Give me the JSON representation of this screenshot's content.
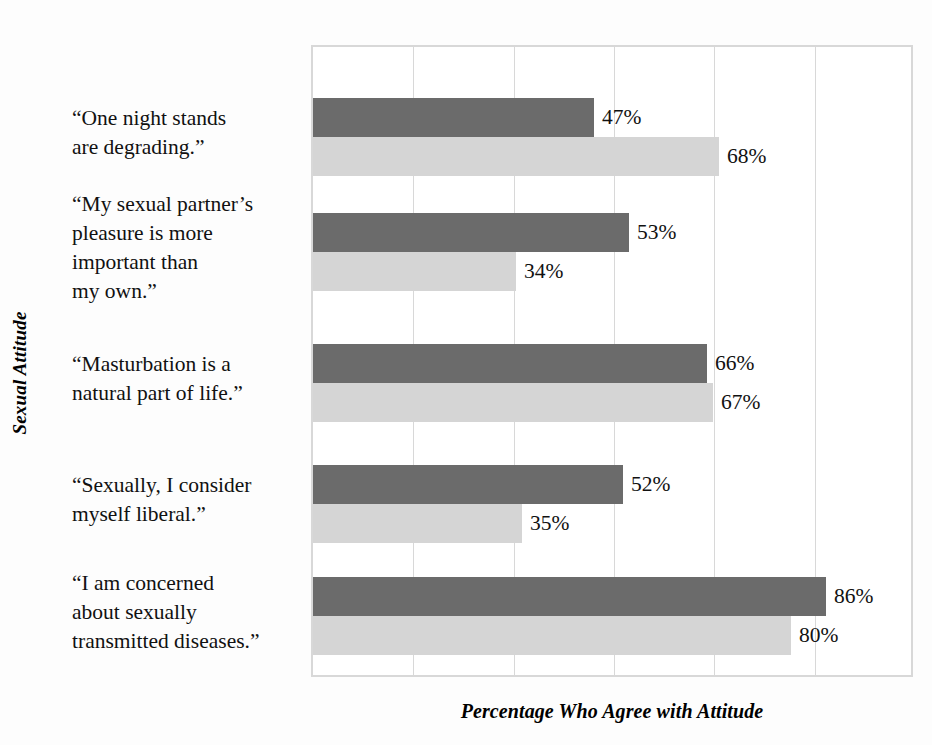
{
  "chart_data": {
    "type": "bar",
    "orientation": "horizontal",
    "title": "",
    "xlabel": "Percentage Who Agree with Attitude",
    "ylabel": "Sexual Attitude",
    "xlim": [
      0,
      100
    ],
    "grid": true,
    "gridline_count": 6,
    "legend_position": "top-right",
    "value_suffix": "%",
    "categories": [
      "“One night stands are degrading.”",
      "“My sexual partner’s pleasure is more important than my own.”",
      "“Masturbation is a natural part of life.”",
      "“Sexually, I consider myself liberal.”",
      "“I am concerned about sexually transmitted diseases.”"
    ],
    "category_lines": [
      [
        "“One night stands",
        "are degrading.”"
      ],
      [
        "“My sexual partner’s",
        "pleasure is more",
        "important than",
        "my own.”"
      ],
      [
        "“Masturbation is a",
        "natural part of life.”"
      ],
      [
        "“Sexually, I consider",
        "myself liberal.”"
      ],
      [
        "“I am concerned",
        "about sexually",
        "transmitted diseases.”"
      ]
    ],
    "series": [
      {
        "name": "Men",
        "color": "#6b6b6b",
        "values": [
          47,
          53,
          66,
          52,
          86
        ]
      },
      {
        "name": "Women",
        "color": "#d5d5d5",
        "values": [
          68,
          34,
          67,
          35,
          80
        ]
      }
    ],
    "data_labels": [
      {
        "category": 0,
        "series": "Men",
        "text": "47%"
      },
      {
        "category": 0,
        "series": "Women",
        "text": "68%"
      },
      {
        "category": 1,
        "series": "Men",
        "text": "53%"
      },
      {
        "category": 1,
        "series": "Women",
        "text": "34%"
      },
      {
        "category": 2,
        "series": "Men",
        "text": "66%"
      },
      {
        "category": 2,
        "series": "Women",
        "text": "67%"
      },
      {
        "category": 3,
        "series": "Men",
        "text": "52%"
      },
      {
        "category": 3,
        "series": "Women",
        "text": "35%"
      },
      {
        "category": 4,
        "series": "Men",
        "text": "86%"
      },
      {
        "category": 4,
        "series": "Women",
        "text": "80%"
      }
    ]
  },
  "legend": {
    "items": [
      {
        "label": "Men",
        "color": "#6b6b6b"
      },
      {
        "label": "Women",
        "color": "#d5d5d5"
      }
    ]
  },
  "axes": {
    "x_title": "Percentage Who Agree with Attitude",
    "y_title": "Sexual Attitude"
  },
  "colors": {
    "men": "#6b6b6b",
    "women": "#d5d5d5",
    "grid": "#d8d8d8",
    "text": "#111111",
    "background": "#fdfdfd",
    "plot_background": "#ffffff"
  }
}
